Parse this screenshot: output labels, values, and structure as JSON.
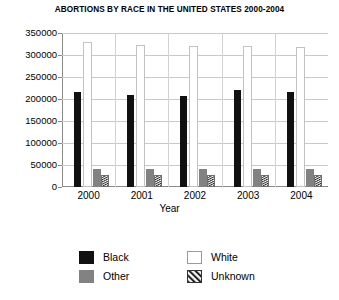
{
  "chart_data": {
    "type": "bar",
    "title": "ABORTIONS BY RACE IN THE UNITED STATES 2000-2004",
    "xlabel": "Year",
    "ylabel": "",
    "categories": [
      "2000",
      "2001",
      "2002",
      "2003",
      "2004"
    ],
    "ylim": [
      0,
      350000
    ],
    "ytick_labels": [
      "350000",
      "300000",
      "250000",
      "200000",
      "150000",
      "100000",
      "50000",
      "0"
    ],
    "ytick_values": [
      350000,
      300000,
      250000,
      200000,
      150000,
      100000,
      50000,
      0
    ],
    "grid": true,
    "legend_position": "bottom",
    "series": [
      {
        "name": "Black",
        "color": "#111111",
        "fill": "solid",
        "values": [
          215000,
          210000,
          207000,
          220000,
          216000
        ]
      },
      {
        "name": "White",
        "color": "#ffffff",
        "fill": "outline",
        "values": [
          330000,
          322000,
          320000,
          320000,
          318000
        ]
      },
      {
        "name": "Other",
        "color": "#828282",
        "fill": "solid",
        "values": [
          40000,
          40000,
          40000,
          40000,
          40000
        ]
      },
      {
        "name": "Unknown",
        "color": "#ffffff",
        "fill": "hatch",
        "values": [
          28000,
          28000,
          28000,
          28000,
          28000
        ]
      }
    ]
  },
  "legend": {
    "items": [
      {
        "label": "Black",
        "swatch": "solid-black-swatch"
      },
      {
        "label": "White",
        "swatch": "outline-white-swatch"
      },
      {
        "label": "Other",
        "swatch": "solid-gray-swatch"
      },
      {
        "label": "Unknown",
        "swatch": "hatched-swatch"
      }
    ]
  }
}
